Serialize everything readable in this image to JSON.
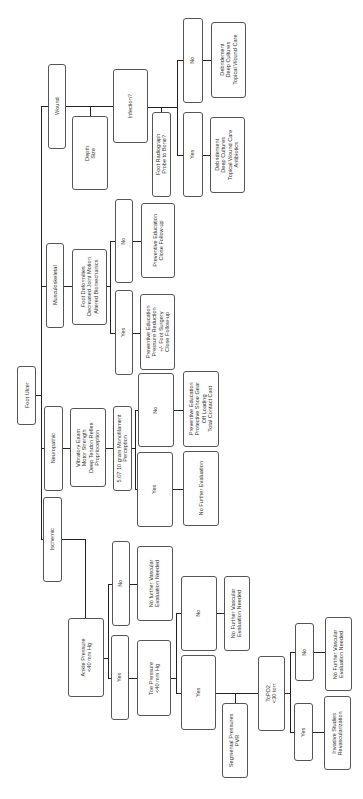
{
  "diagram": {
    "title": "Foot Ulcer",
    "orientation": "rotated-90-ccw",
    "nodes": {
      "root": "Foot Ulcer",
      "wound": "Wound",
      "depth_size": "Depth\nSize",
      "infection": "Infection?",
      "foot_radiograph": "Foot Radiograph\nProbe to Bone?",
      "inf_no": "No",
      "inf_yes": "Yes",
      "inf_no_tx": "Debridement\nDeep Cultures\nTopical Wound Care",
      "inf_yes_tx": "Debridement\nDeep Cultures\nTopical Wound Care\nAntibiotics",
      "musculoskeletal": "Musculoskeletal",
      "foot_deformities": "Foot Deformities\nDecreased Joint Motion\nAltered Biomechanics",
      "msk_no": "No",
      "msk_yes": "Yes",
      "msk_no_tx": "Preventive Education\nClose Follow-up",
      "msk_yes_tx": "Preventive Education\nPressure Reduction\n+/- Foot Surgery\nClose Follow-up",
      "neuropathic": "Neuropathic",
      "vibratory": "Vibratory Exam\nMotor Strength\nDeep Tendon Reflex\nProprioception",
      "monofilament": "5.07 10 gram Monofilament\nPerception",
      "neuro_no": "No",
      "neuro_yes": "Yes",
      "neuro_no_tx": "Preventive Education\nProtective Shoe Gear\nOff Loading\nTotal Contact Cast",
      "neuro_yes_tx": "No Further Evaluation",
      "ischemic": "Ischemic",
      "ankle_pressure": "Ankle Pressure\n<40 mm Hg",
      "ankle_no": "No",
      "ankle_yes": "Yes",
      "ankle_no_tx": "No further Vascular\nEvaluation Needed",
      "toe_pressure": "Toe Pressure\n<40 mm Hg",
      "toe_no": "No",
      "toe_yes": "Yes",
      "toe_no_tx": "No Further Vascular\nEvaluation Needed",
      "segmental": "Segmental Pressures\nPVR",
      "tcpo2": "TcPO2\n<30 torr",
      "tcpo2_no": "No",
      "tcpo2_yes": "Yes",
      "tcpo2_no_tx": "No Further Vascular\nEvaluation Needed",
      "tcpo2_yes_tx": "Invasive Studies\nRevascularization"
    },
    "colors": {
      "line": "#222222",
      "border": "#555555",
      "text": "#333333"
    }
  }
}
